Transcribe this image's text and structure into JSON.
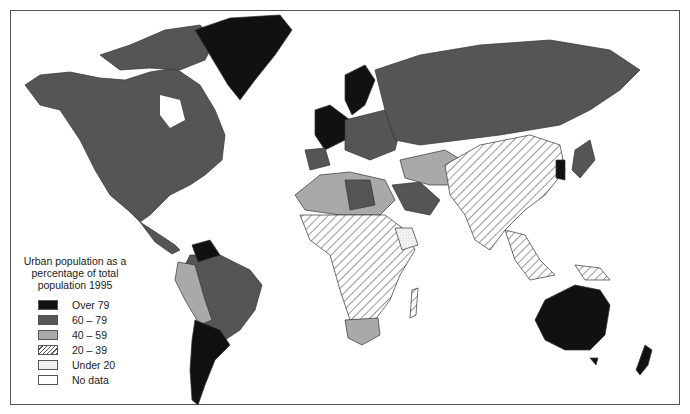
{
  "map": {
    "subject": "World map — urban population as a percentage of total population, 1995",
    "legend": {
      "title": "Urban population as a percentage of total population 1995",
      "title_lines": [
        "Urban population as a",
        "percentage of total",
        "population 1995"
      ],
      "items": [
        {
          "label": "Over 79",
          "fill": "#111111",
          "pattern": "solid"
        },
        {
          "label": "60 – 79",
          "fill": "#555555",
          "pattern": "solid"
        },
        {
          "label": "40 – 59",
          "fill": "#a9a9a9",
          "pattern": "solid"
        },
        {
          "label": "20 – 39",
          "fill": "#ffffff",
          "pattern": "diagonal-hatch"
        },
        {
          "label": "Under 20",
          "fill": "#f0f0f0",
          "pattern": "stipple"
        },
        {
          "label": "No data",
          "fill": "#ffffff",
          "pattern": "blank"
        }
      ]
    },
    "regions": [
      {
        "name": "Greenland",
        "class": "Over 79"
      },
      {
        "name": "North America (USA, Canada)",
        "class": "60 – 79"
      },
      {
        "name": "Mexico",
        "class": "60 – 79"
      },
      {
        "name": "Venezuela",
        "class": "Over 79"
      },
      {
        "name": "Brazil",
        "class": "60 – 79"
      },
      {
        "name": "Argentina / Chile / Uruguay",
        "class": "Over 79"
      },
      {
        "name": "Bolivia / Paraguay / Ecuador",
        "class": "40 – 59"
      },
      {
        "name": "Russia",
        "class": "60 – 79"
      },
      {
        "name": "Western Europe / Scandinavia",
        "class": "Over 79"
      },
      {
        "name": "Eastern Europe",
        "class": "60 – 79"
      },
      {
        "name": "North Africa",
        "class": "40 – 59"
      },
      {
        "name": "Libya / Saudi Arabia",
        "class": "60 – 79"
      },
      {
        "name": "Sub-Saharan Africa",
        "class": "20 – 39"
      },
      {
        "name": "Ethiopia",
        "class": "Under 20"
      },
      {
        "name": "South Africa",
        "class": "40 – 59"
      },
      {
        "name": "China / India / SE Asia",
        "class": "20 – 39"
      },
      {
        "name": "Iran / Central Asia",
        "class": "40 – 59"
      },
      {
        "name": "Japan / Korea",
        "class": "Over 79"
      },
      {
        "name": "Australia",
        "class": "Over 79"
      },
      {
        "name": "New Zealand",
        "class": "Over 79"
      }
    ]
  }
}
